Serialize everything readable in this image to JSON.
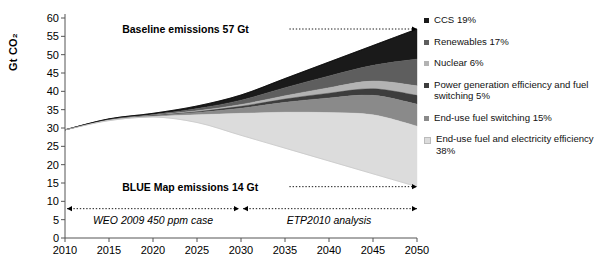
{
  "chart_data": {
    "type": "area",
    "title": "",
    "xlabel": "",
    "ylabel": "Gt CO₂",
    "xlim": [
      2010,
      2050
    ],
    "ylim": [
      0,
      60
    ],
    "ytick_step": 5,
    "grid": false,
    "legend_position": "right",
    "x": [
      2010,
      2015,
      2020,
      2025,
      2030,
      2035,
      2040,
      2045,
      2050
    ],
    "ytick_labels": [
      "60",
      "55",
      "50",
      "45",
      "40",
      "35",
      "30",
      "25",
      "20",
      "15",
      "10",
      "5",
      "0"
    ],
    "xtick_labels": [
      "2010",
      "2015",
      "2020",
      "2025",
      "2030",
      "2035",
      "2040",
      "2045",
      "2050"
    ],
    "baseline": {
      "name": "Baseline emissions",
      "values": [
        29.5,
        32.5,
        34.0,
        36.0,
        39.0,
        43.5,
        48.0,
        52.5,
        57.0
      ],
      "end_value": 57,
      "end_label": "Baseline emissions 57 Gt"
    },
    "blue_map": {
      "name": "BLUE Map emissions",
      "values": [
        29.5,
        32.0,
        33.0,
        31.5,
        28.0,
        24.5,
        21.0,
        17.5,
        14.0
      ],
      "end_value": 14,
      "end_label": "BLUE Map emissions 14 Gt"
    },
    "series": [
      {
        "name": "CCS",
        "share_pct": 19,
        "label": "CCS 19%",
        "color": "#1a1a1a",
        "upper": [
          29.5,
          32.5,
          34.0,
          36.0,
          39.0,
          43.5,
          48.0,
          52.5,
          57.0
        ],
        "lower": [
          29.5,
          32.4,
          33.7,
          35.3,
          37.6,
          41.0,
          44.2,
          47.1,
          48.8
        ]
      },
      {
        "name": "Renewables",
        "share_pct": 17,
        "label": "Renewables 17%",
        "color": "#5e5e5e",
        "upper": [
          29.5,
          32.4,
          33.7,
          35.3,
          37.6,
          41.0,
          44.2,
          47.1,
          48.8
        ],
        "lower": [
          29.5,
          32.3,
          33.5,
          34.7,
          36.4,
          38.8,
          41.0,
          42.8,
          41.5
        ]
      },
      {
        "name": "Nuclear",
        "share_pct": 6,
        "label": "Nuclear 6%",
        "color": "#b3b3b3",
        "upper": [
          29.5,
          32.3,
          33.5,
          34.7,
          36.4,
          38.8,
          41.0,
          42.8,
          41.5
        ],
        "lower": [
          29.5,
          32.25,
          33.4,
          34.45,
          35.9,
          37.9,
          39.5,
          40.7,
          38.9
        ]
      },
      {
        "name": "Power generation efficiency and fuel switching",
        "share_pct": 5,
        "label": "Power generation efficiency and fuel switching 5%",
        "color": "#3d3d3d",
        "upper": [
          29.5,
          32.25,
          33.4,
          34.45,
          35.9,
          37.9,
          39.5,
          40.7,
          38.9
        ],
        "lower": [
          29.5,
          32.2,
          33.3,
          34.2,
          35.4,
          37.0,
          38.2,
          38.9,
          36.5
        ]
      },
      {
        "name": "End-use fuel switching",
        "share_pct": 15,
        "label": "End-use fuel switching 15%",
        "color": "#8a8a8a",
        "upper": [
          29.5,
          32.2,
          33.3,
          34.2,
          35.4,
          37.0,
          38.2,
          38.9,
          36.5
        ],
        "lower": [
          29.5,
          32.1,
          33.1,
          33.6,
          34.0,
          34.3,
          34.2,
          33.6,
          30.5
        ]
      },
      {
        "name": "End-use fuel and electricity efficiency",
        "share_pct": 38,
        "label": "End-use fuel and electricity efficiency 38%",
        "color": "#dcdcdc",
        "upper": [
          29.5,
          32.1,
          33.1,
          33.6,
          34.0,
          34.3,
          34.2,
          33.6,
          30.5
        ],
        "lower": [
          29.5,
          32.0,
          33.0,
          31.5,
          28.0,
          24.5,
          21.0,
          17.5,
          14.0
        ]
      }
    ],
    "annotations": [
      {
        "id": "baseline-annotation",
        "text": "Baseline emissions 57 Gt",
        "x_start": 2030,
        "y": 57
      },
      {
        "id": "bluemap-annotation",
        "text": "BLUE Map emissions 14 Gt",
        "x_start": 2030,
        "y": 14
      }
    ],
    "periods": [
      {
        "id": "weo-period",
        "label": "WEO 2009 450 ppm case",
        "from": 2010,
        "to": 2030,
        "y": 8
      },
      {
        "id": "etp-period",
        "label": "ETP2010 analysis",
        "from": 2030,
        "to": 2050,
        "y": 8
      }
    ]
  },
  "legend": {
    "items": [
      {
        "label": "CCS 19%",
        "color": "#1a1a1a",
        "name": "legend-item-ccs"
      },
      {
        "label": "Renewables 17%",
        "color": "#5e5e5e",
        "name": "legend-item-renewables"
      },
      {
        "label": "Nuclear 6%",
        "color": "#b3b3b3",
        "name": "legend-item-nuclear"
      },
      {
        "label": "Power generation efficiency and fuel switching 5%",
        "color": "#3d3d3d",
        "name": "legend-item-power-generation"
      },
      {
        "label": "End-use fuel switching 15%",
        "color": "#8a8a8a",
        "name": "legend-item-end-use-fuel-switching"
      },
      {
        "label": "End-use fuel and electricity efficiency 38%",
        "color": "#dcdcdc",
        "name": "legend-item-end-use-efficiency"
      }
    ]
  }
}
